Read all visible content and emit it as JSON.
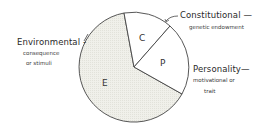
{
  "diagram": {
    "type": "pie",
    "segments": [
      {
        "letter": "C",
        "name": "Constitutional",
        "description": "genetic endowment"
      },
      {
        "letter": "P",
        "name": "Personality",
        "description": "motivational or trait"
      },
      {
        "letter": "E",
        "name": "Environmental",
        "description": "consequence or stimuli"
      }
    ],
    "labels": {
      "constitutional": {
        "title": "Constitutional —",
        "sub": "genetic endowment"
      },
      "environmental": {
        "title": "Environmental -",
        "sub1": "consequence",
        "sub2": "or stimuli"
      },
      "personality": {
        "title": "Personality—",
        "sub1": "motivational or",
        "sub2": "trait"
      }
    },
    "colors": {
      "stroke": "#444444",
      "shaded_fill": "#ecece6",
      "unshaded_fill": "#ffffff"
    }
  }
}
